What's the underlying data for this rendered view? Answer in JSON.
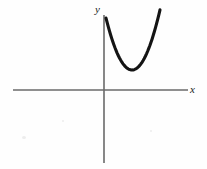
{
  "figure": {
    "background_color": "#fefefe",
    "width": 207,
    "height": 169,
    "axis_color": "#6a6a6a",
    "curve_color": "#141414",
    "label_color": "#1a1a1a",
    "axis_stroke_width": 1.6,
    "curve_stroke_width": 3.1
  },
  "axes": {
    "origin": {
      "x": 104,
      "y": 90
    },
    "x_axis": {
      "x_start": 13,
      "x_end": 188,
      "y": 90
    },
    "y_axis": {
      "x": 104,
      "y_start": 15,
      "y_end": 163
    },
    "x_label": "x",
    "y_label": "y"
  },
  "chart_data": {
    "type": "line",
    "title": "",
    "subtitle": "",
    "xlabel": "x",
    "ylabel": "y",
    "grid": false,
    "legend": null,
    "annotations": [],
    "xlim": [
      -3.2,
      2.9
    ],
    "ylim": [
      -2.5,
      1.3
    ],
    "series": [
      {
        "name": "parabola",
        "shape": "upward-parabola",
        "vertex_pixel": {
          "x": 132,
          "y": 70
        },
        "left_end_pixel": {
          "x": 106,
          "y": 14
        },
        "right_end_pixel": {
          "x": 160,
          "y": 14
        },
        "vertex": {
          "x": 0.62,
          "y": 0.36
        },
        "x": [
          0.05,
          0.17,
          0.3,
          0.43,
          0.56,
          0.62,
          0.7,
          0.84,
          0.97,
          1.1,
          1.22
        ],
        "y": [
          1.3,
          0.91,
          0.62,
          0.43,
          0.37,
          0.36,
          0.38,
          0.52,
          0.76,
          1.05,
          1.3
        ]
      }
    ]
  }
}
